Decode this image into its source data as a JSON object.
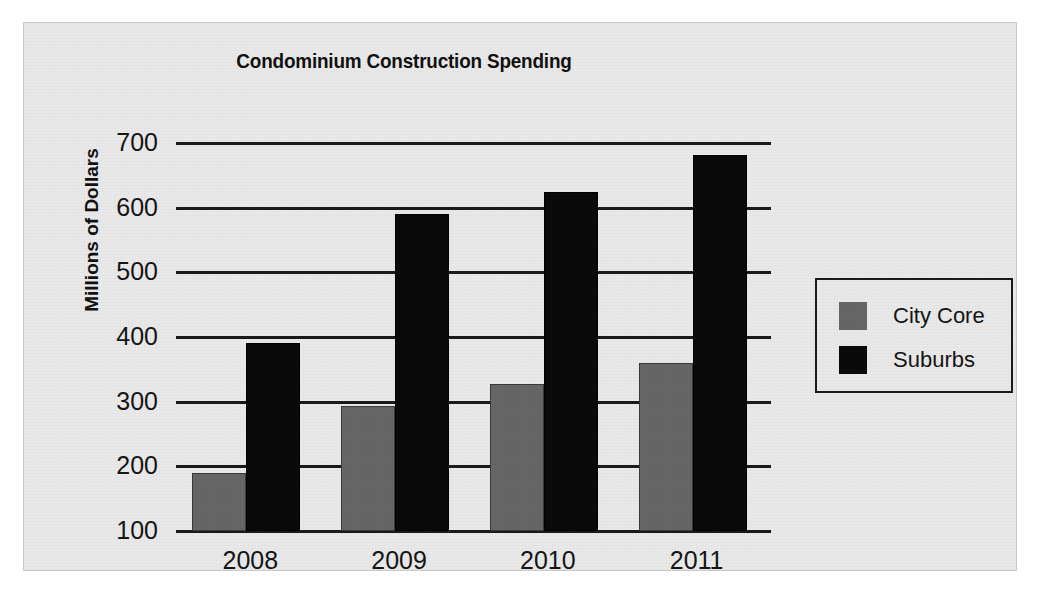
{
  "chart_data": {
    "type": "bar",
    "title": "Condominium Construction Spending",
    "xlabel": "",
    "ylabel": "Millions of Dollars",
    "categories": [
      "2008",
      "2009",
      "2010",
      "2011"
    ],
    "series": [
      {
        "name": "City Core",
        "color": "#666666",
        "values": [
          190,
          293,
          327,
          360
        ]
      },
      {
        "name": "Suburbs",
        "color": "#0a0a0a",
        "values": [
          390,
          590,
          625,
          682
        ]
      }
    ],
    "ylim": [
      100,
      700
    ],
    "yticks": [
      100,
      200,
      300,
      400,
      500,
      600,
      700
    ],
    "ytick_labels": [
      "100",
      "200",
      "300",
      "400",
      "500",
      "600",
      "700"
    ],
    "grid": true,
    "grid_axis": "y",
    "legend_position": "right",
    "legend_entries": [
      "City Core",
      "Suburbs"
    ]
  },
  "legend": {
    "items": [
      {
        "label": "City Core",
        "swatch": "city-core-swatch"
      },
      {
        "label": "Suburbs",
        "swatch": "suburbs-swatch"
      }
    ]
  },
  "colors": {
    "background": "#e9e9e9",
    "city_core": "#666666",
    "suburbs": "#0a0a0a",
    "axis": "#1a1a1a",
    "text": "#151515"
  }
}
